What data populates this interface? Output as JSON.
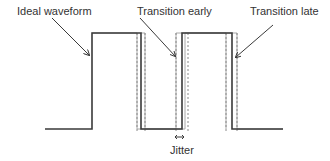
{
  "labels": {
    "ideal": "Ideal waveform",
    "early": "Transition early",
    "late": "Transition late",
    "jitter": "Jitter"
  },
  "colors": {
    "ideal_line": "#3a3a3a",
    "offset_line": "#9a9a9a",
    "dashed_line": "#8a8a8a",
    "text": "#333333"
  },
  "waveform": {
    "baseline_y": 129,
    "high_y": 33,
    "ideal_edges_x": [
      92,
      141,
      182,
      232
    ],
    "early_edges_x": [
      137,
      176,
      226
    ],
    "late_edges_x": [
      145,
      185,
      237
    ]
  }
}
